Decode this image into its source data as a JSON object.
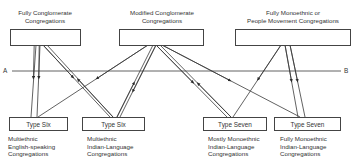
{
  "diagram": {
    "top_nodes": [
      {
        "id": "fully-conglomerate",
        "label_lines": [
          "Fully Conglomerate",
          "Congregations"
        ]
      },
      {
        "id": "modified-conglomerate",
        "label_lines": [
          "Modified Conglomerate",
          "Congregations"
        ]
      },
      {
        "id": "fully-monoethnic",
        "label_lines": [
          "Fully Monoethnic or",
          "People Movement Congregations"
        ]
      }
    ],
    "divider": {
      "left_label": "A",
      "right_label": "B"
    },
    "bottom_nodes": [
      {
        "id": "type-six-english",
        "box_label": "Type Six",
        "caption_lines": [
          "Multiethnic",
          "English-speaking",
          "Congregations"
        ]
      },
      {
        "id": "type-six-indian",
        "box_label": "Type Six",
        "caption_lines": [
          "Multiethnic",
          "Indian-Language",
          "Congregations"
        ]
      },
      {
        "id": "type-seven-mostly",
        "box_label": "Type Seven",
        "caption_lines": [
          "Mostly Monoethnic",
          "Indian-Language",
          "Congregations"
        ]
      },
      {
        "id": "type-seven-fully",
        "box_label": "Type Seven",
        "caption_lines": [
          "Fully Monoethnic",
          "Indian-Language",
          "Congregations"
        ]
      }
    ],
    "edges": [
      {
        "from": "fully-conglomerate",
        "to": "type-six-english",
        "direction": "down"
      },
      {
        "from": "fully-conglomerate",
        "to": "type-six-english",
        "direction": "down"
      },
      {
        "from": "fully-conglomerate",
        "to": "type-six-indian",
        "direction": "down"
      },
      {
        "from": "type-six-indian",
        "to": "fully-conglomerate",
        "direction": "up"
      },
      {
        "from": "type-six-english",
        "to": "modified-conglomerate",
        "direction": "up"
      },
      {
        "from": "modified-conglomerate",
        "to": "type-six-indian",
        "direction": "down"
      },
      {
        "from": "type-six-indian",
        "to": "modified-conglomerate",
        "direction": "up"
      },
      {
        "from": "modified-conglomerate",
        "to": "type-seven-mostly",
        "direction": "down"
      },
      {
        "from": "type-seven-mostly",
        "to": "modified-conglomerate",
        "direction": "up"
      },
      {
        "from": "modified-conglomerate",
        "to": "type-seven-fully",
        "direction": "down"
      },
      {
        "from": "fully-monoethnic",
        "to": "type-seven-mostly",
        "direction": "down"
      },
      {
        "from": "fully-monoethnic",
        "to": "type-seven-fully",
        "direction": "down"
      },
      {
        "from": "fully-monoethnic",
        "to": "type-seven-fully",
        "direction": "down"
      }
    ],
    "colors": {
      "line": "#3a3a3a",
      "text": "#333333",
      "background": "#ffffff"
    }
  }
}
